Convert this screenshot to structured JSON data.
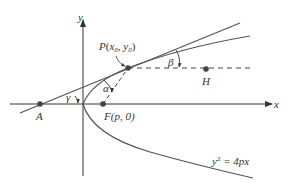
{
  "diagram": {
    "axes": {
      "x_label": "x",
      "y_label": "y"
    },
    "curve": {
      "equation_lhs": "y",
      "equation_exp": "2",
      "equation_rhs": " = 4px"
    },
    "points": {
      "P": {
        "name": "P",
        "coords_open": "(",
        "x_sub": "x",
        "x_subscript": "0",
        "sep": ", ",
        "y_sub": "y",
        "y_subscript": "0",
        "coords_close": ")"
      },
      "F": {
        "label": "F(p, 0)"
      },
      "A": {
        "label": "A"
      },
      "H": {
        "label": "H"
      }
    },
    "angles": {
      "alpha": "α",
      "beta": "β",
      "gamma": "γ"
    },
    "colors": {
      "line": "#555555",
      "point": "#444444",
      "text": "#333333"
    }
  }
}
